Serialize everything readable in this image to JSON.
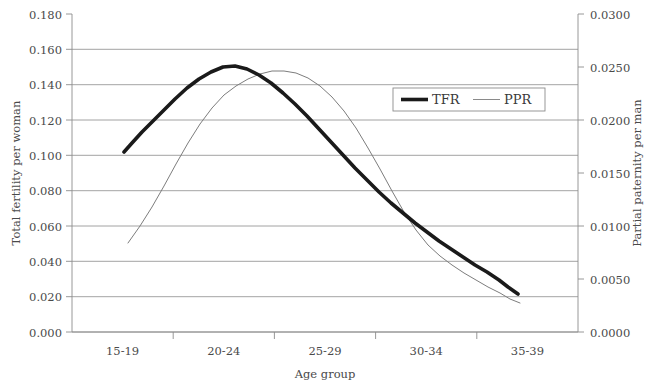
{
  "chart_data": {
    "type": "line",
    "title": "",
    "xlabel": "Age group",
    "ylabel": "Total fertility per woman",
    "y2label": "Partial paternity per man",
    "categories": [
      "15-19",
      "20-24",
      "25-29",
      "30-34",
      "35-39"
    ],
    "ylim": [
      0.0,
      0.18
    ],
    "y2lim": [
      0.0,
      0.03
    ],
    "yticks": [
      "0.000",
      "0.020",
      "0.040",
      "0.060",
      "0.080",
      "0.100",
      "0.120",
      "0.140",
      "0.160",
      "0.180"
    ],
    "y2ticks": [
      "0.0000",
      "0.0050",
      "0.0100",
      "0.0150",
      "0.0200",
      "0.0250",
      "0.0300"
    ],
    "grid": true,
    "legend_position": "inside-upper-right",
    "series": [
      {
        "name": "TFR",
        "axis": "left",
        "values": [
          0.102,
          0.1505,
          0.1095,
          0.0585,
          0.0215
        ],
        "points": [
          [
            124,
            152
          ],
          [
            132,
            143
          ],
          [
            142,
            132
          ],
          [
            152,
            122
          ],
          [
            163,
            111
          ],
          [
            175,
            99
          ],
          [
            187,
            88
          ],
          [
            199,
            79
          ],
          [
            211,
            72
          ],
          [
            223,
            67
          ],
          [
            235,
            66
          ],
          [
            247,
            69
          ],
          [
            259,
            75
          ],
          [
            271,
            83
          ],
          [
            283,
            93
          ],
          [
            295,
            104
          ],
          [
            307,
            116
          ],
          [
            319,
            129
          ],
          [
            331,
            142
          ],
          [
            343,
            155
          ],
          [
            355,
            168
          ],
          [
            367,
            180
          ],
          [
            379,
            192
          ],
          [
            391,
            203
          ],
          [
            403,
            213
          ],
          [
            415,
            223
          ],
          [
            427,
            232
          ],
          [
            439,
            241
          ],
          [
            451,
            249
          ],
          [
            463,
            257
          ],
          [
            475,
            265
          ],
          [
            487,
            272
          ],
          [
            499,
            280
          ],
          [
            508,
            287
          ],
          [
            518,
            294
          ]
        ]
      },
      {
        "name": "PPR",
        "axis": "right",
        "values": [
          0.0084,
          0.0228,
          0.0246,
          0.0093,
          0.0029
        ],
        "points": [
          [
            128,
            243
          ],
          [
            140,
            226
          ],
          [
            152,
            207
          ],
          [
            164,
            186
          ],
          [
            176,
            164
          ],
          [
            188,
            143
          ],
          [
            200,
            124
          ],
          [
            212,
            108
          ],
          [
            224,
            95
          ],
          [
            236,
            86
          ],
          [
            248,
            79
          ],
          [
            260,
            74
          ],
          [
            272,
            71
          ],
          [
            284,
            71
          ],
          [
            296,
            73
          ],
          [
            308,
            78
          ],
          [
            320,
            86
          ],
          [
            332,
            97
          ],
          [
            344,
            111
          ],
          [
            356,
            128
          ],
          [
            368,
            148
          ],
          [
            380,
            169
          ],
          [
            392,
            191
          ],
          [
            404,
            212
          ],
          [
            416,
            230
          ],
          [
            428,
            245
          ],
          [
            440,
            256
          ],
          [
            452,
            265
          ],
          [
            464,
            273
          ],
          [
            476,
            280
          ],
          [
            488,
            287
          ],
          [
            500,
            293
          ],
          [
            510,
            299
          ],
          [
            520,
            303
          ]
        ]
      }
    ]
  },
  "legend": {
    "items": [
      {
        "label": "TFR"
      },
      {
        "label": "PPR"
      }
    ]
  }
}
